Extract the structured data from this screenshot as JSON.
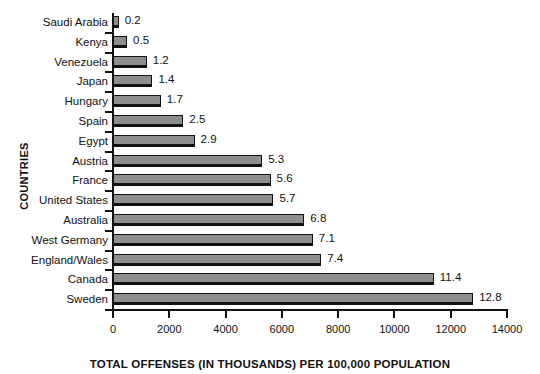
{
  "chart_data": {
    "type": "bar",
    "orientation": "horizontal",
    "title": "",
    "xlabel": "TOTAL OFFENSES (IN THOUSANDS) PER 100,000 POPULATION",
    "ylabel": "COUNTRIES",
    "xlim": [
      0,
      14000
    ],
    "xticks": [
      0,
      2000,
      4000,
      6000,
      8000,
      10000,
      12000,
      14000
    ],
    "xticklabels": [
      "0",
      "2000",
      "4000",
      "6000",
      "8000",
      "10000",
      "12000",
      "14000"
    ],
    "grid": false,
    "legend": false,
    "bar_color": "#8e8e8e",
    "bar_edge_color": "#111111",
    "categories": [
      "Saudi Arabia",
      "Kenya",
      "Venezuela",
      "Japan",
      "Hungary",
      "Spain",
      "Egypt",
      "Austria",
      "France",
      "United States",
      "Australia",
      "West Germany",
      "England/Wales",
      "Canada",
      "Sweden"
    ],
    "values": [
      200,
      500,
      1200,
      1400,
      1700,
      2500,
      2900,
      5300,
      5600,
      5700,
      6800,
      7100,
      7400,
      11400,
      12800
    ],
    "data_labels": [
      "0.2",
      "0.5",
      "1.2",
      "1.4",
      "1.7",
      "2.5",
      "2.9",
      "5.3",
      "5.6",
      "5.7",
      "6.8",
      "7.1",
      "7.4",
      "11.4",
      "12.8"
    ]
  }
}
